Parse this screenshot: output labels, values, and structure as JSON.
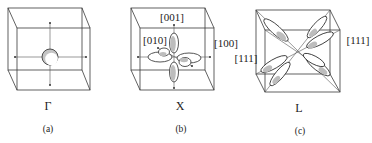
{
  "panels": [
    {
      "id": "a",
      "point_label": "Γ",
      "caption": "(a)",
      "description": "Sphere at cube center with axes"
    },
    {
      "id": "b",
      "point_label": "X",
      "caption": "(b)",
      "direction_labels": [
        "[001]",
        "[010]",
        "[100]"
      ],
      "description": "Ellipsoids along the cube axes"
    },
    {
      "id": "c",
      "point_label": "L",
      "caption": "(c)",
      "direction_labels": [
        "[111]",
        "[111]"
      ],
      "description": "Elongated ellipsoids along body diagonals"
    }
  ],
  "colors": {
    "line": "#3a3a3a",
    "shade": "#bdbdbd",
    "background": "#ffffff"
  }
}
